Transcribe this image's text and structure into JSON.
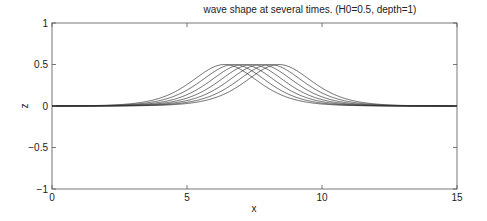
{
  "chart_data": {
    "type": "line",
    "title": "wave shape at several times. (H0=0.5, depth=1)",
    "xlabel": "x",
    "ylabel": "z",
    "xlim": [
      0,
      15
    ],
    "ylim": [
      -1,
      1
    ],
    "xticks": [
      0,
      5,
      10,
      15
    ],
    "xtick_labels": [
      "0",
      "5",
      "10",
      "15"
    ],
    "yticks": [
      -1,
      -0.5,
      0,
      0.5,
      1
    ],
    "ytick_labels": [
      "−1",
      "−0.5",
      "0",
      "0.5",
      "1"
    ],
    "grid": false,
    "legend": null,
    "line_color": "#333333",
    "model": "z = H0 * sech^2(k (x - x_peak)), k = sqrt(3*H0/4)",
    "H0": 0.5,
    "depth": 1,
    "k": 0.612,
    "series": [
      {
        "name": "t1",
        "peak_x": 6.4,
        "peak_z": 0.5
      },
      {
        "name": "t2",
        "peak_x": 6.73,
        "peak_z": 0.5
      },
      {
        "name": "t3",
        "peak_x": 7.07,
        "peak_z": 0.5
      },
      {
        "name": "t4",
        "peak_x": 7.4,
        "peak_z": 0.5
      },
      {
        "name": "t5",
        "peak_x": 7.73,
        "peak_z": 0.5
      },
      {
        "name": "t6",
        "peak_x": 8.07,
        "peak_z": 0.5
      },
      {
        "name": "t7",
        "peak_x": 8.4,
        "peak_z": 0.5
      }
    ]
  }
}
